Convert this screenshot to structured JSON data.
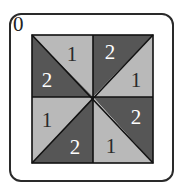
{
  "card": {
    "label": "0",
    "colors": {
      "light": "#b9b9b9",
      "dark": "#565656",
      "line": "#111111",
      "light_text": "#2a2a2a",
      "dark_text": "#ffffff"
    },
    "triangles": [
      {
        "id": "top-left-upper",
        "value": "1",
        "shade": "light"
      },
      {
        "id": "top-left-lower",
        "value": "2",
        "shade": "dark"
      },
      {
        "id": "top-right-upper",
        "value": "2",
        "shade": "dark"
      },
      {
        "id": "top-right-lower",
        "value": "1",
        "shade": "light"
      },
      {
        "id": "bottom-left-upper",
        "value": "1",
        "shade": "light"
      },
      {
        "id": "bottom-left-lower",
        "value": "2",
        "shade": "dark"
      },
      {
        "id": "bottom-right-upper",
        "value": "2",
        "shade": "dark"
      },
      {
        "id": "bottom-right-lower",
        "value": "1",
        "shade": "light"
      }
    ]
  }
}
